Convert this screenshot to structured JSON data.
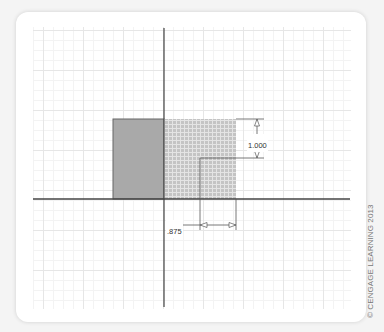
{
  "diagram": {
    "shapes": {
      "solid_square": {
        "fill": "#a9a9a9",
        "stroke": "#555555"
      },
      "hatched_square": {
        "fill": "#c4c4c4",
        "pattern_line": "#e2e2e2"
      }
    },
    "dimensions": {
      "height_label": "1.000",
      "offset_label": ".875"
    },
    "axis_color": "#444444",
    "grid_color": "#e6e6e6"
  },
  "footer": {
    "copyright": "© CENGAGE LEARNING 2013"
  }
}
